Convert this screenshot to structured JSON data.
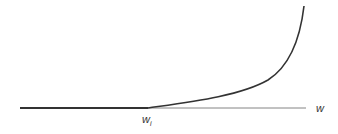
{
  "diagram": {
    "axis_label": "w",
    "threshold_label": "w",
    "threshold_subscript": "i",
    "line_color": "#333333",
    "axis_color": "#555555"
  }
}
